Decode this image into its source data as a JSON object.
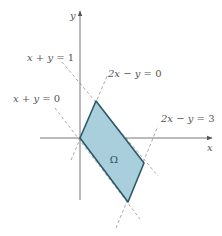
{
  "diagram": {
    "type": "region-in-plane",
    "axes": {
      "x_label": "x",
      "y_label": "y"
    },
    "region": {
      "label": "Ω",
      "fill": "#a9cfdc",
      "stroke": "#2c5a6b",
      "vertices_math": [
        [
          0,
          0
        ],
        [
          0.333,
          0.667
        ],
        [
          1.333,
          -0.333
        ],
        [
          1,
          -1
        ]
      ]
    },
    "lines": [
      {
        "id": "line1",
        "label_lhs": "x + y = ",
        "label_rhs": "1"
      },
      {
        "id": "line2",
        "label_lhs": "x + y = ",
        "label_rhs": "0"
      },
      {
        "id": "line3",
        "label_lhs": "2x − y = ",
        "label_rhs": "0"
      },
      {
        "id": "line4",
        "label_lhs": "2x − y = ",
        "label_rhs": "3"
      }
    ],
    "colors": {
      "axis": "#777777",
      "dashed": "#aaaaaa",
      "text": "#555555"
    }
  }
}
